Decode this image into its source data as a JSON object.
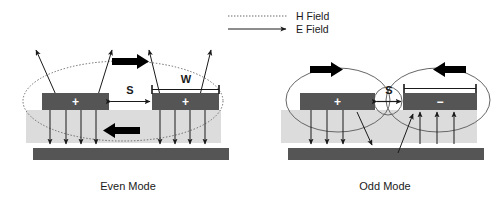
{
  "figure": {
    "type": "coupled-microstrip-cross-section",
    "background_color": "#ffffff"
  },
  "legend": {
    "items": [
      {
        "id": "h-field",
        "label": "H Field",
        "line_style": "dotted",
        "has_arrowhead": false,
        "color": "#3a3a3a"
      },
      {
        "id": "e-field",
        "label": "E Field",
        "line_style": "solid",
        "has_arrowhead": true,
        "color": "#1a1a1a"
      }
    ]
  },
  "colors": {
    "conductor": "#555555",
    "substrate": "#dcdcdc",
    "ground_plane": "#555555",
    "e_field_line": "#1a1a1a",
    "h_field_line": "#666666",
    "block_arrow": "#000000",
    "text": "#1a1a1a"
  },
  "panels": [
    {
      "id": "even-mode",
      "caption": "Even Mode",
      "strips": [
        {
          "id": "left-strip",
          "polarity": "+"
        },
        {
          "id": "right-strip",
          "polarity": "+"
        }
      ],
      "dimensions": [
        {
          "id": "spacing",
          "label": "S"
        },
        {
          "id": "width",
          "label": "W"
        }
      ],
      "h_field_loops": 1,
      "block_arrows": [
        {
          "id": "upper-block-arrow",
          "direction": "right"
        },
        {
          "id": "lower-block-arrow",
          "direction": "left"
        }
      ]
    },
    {
      "id": "odd-mode",
      "caption": "Odd Mode",
      "strips": [
        {
          "id": "left-strip",
          "polarity": "+"
        },
        {
          "id": "right-strip",
          "polarity": "−"
        }
      ],
      "dimensions": [
        {
          "id": "spacing",
          "label": "S"
        },
        {
          "id": "width",
          "label": ""
        }
      ],
      "h_field_loops": 3,
      "block_arrows": [
        {
          "id": "left-block-arrow",
          "direction": "right"
        },
        {
          "id": "right-block-arrow",
          "direction": "left"
        }
      ]
    }
  ]
}
